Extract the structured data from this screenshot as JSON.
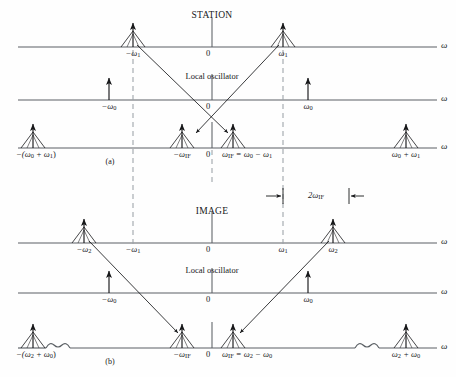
{
  "figure": {
    "title_station": "STATION",
    "title_image": "IMAGE",
    "lo_label_a": "Local oscillator",
    "lo_label_b": "Local oscillator",
    "panel_a_tag": "(a)",
    "panel_b_tag": "(b)",
    "bandwidth_label": "2ω",
    "bandwidth_label_sub": "IF",
    "axis_symbol": "ω",
    "origin_label": "0"
  },
  "colors": {
    "ink": "#17181a",
    "line": "#5a5f64",
    "dashed": "#9aa0a6",
    "background": "#ffffff"
  },
  "panel_a": {
    "name": "STATION",
    "rows": [
      {
        "id": "a-rf",
        "axis_label": "ω",
        "origin": "0",
        "impulses": [
          {
            "id": "a-rf-neg-w1",
            "x": 133,
            "label": "−ω",
            "label_sub": "1",
            "style": "tent"
          },
          {
            "id": "a-rf-pos-w1",
            "x": 283,
            "label": "ω",
            "label_sub": "1",
            "style": "tent"
          }
        ]
      },
      {
        "id": "a-lo",
        "axis_label": "ω",
        "origin": "0",
        "impulses": [
          {
            "id": "a-lo-neg-w0",
            "x": 109,
            "label": "−ω",
            "label_sub": "0",
            "style": "plain"
          },
          {
            "id": "a-lo-pos-w0",
            "x": 308,
            "label": "ω",
            "label_sub": "0",
            "style": "plain"
          }
        ]
      },
      {
        "id": "a-if",
        "axis_label": "ω",
        "origin": "0",
        "impulses": [
          {
            "id": "a-if-neg-sum",
            "x": 33,
            "label": "−(ω",
            "label_sub": "0",
            "label_2": " + ω",
            "label_sub2": "1",
            "label_3": ")",
            "style": "tent"
          },
          {
            "id": "a-if-neg-wif",
            "x": 182,
            "label": "−ω",
            "label_sub": "IF",
            "style": "tent"
          },
          {
            "id": "a-if-pos-wif",
            "x": 233,
            "label": "ω",
            "label_sub": "IF",
            "label_2": " = ω",
            "label_sub2": "0",
            "label_3": " − ω",
            "label_sub3": "1",
            "style": "tent"
          },
          {
            "id": "a-if-pos-sum",
            "x": 406,
            "label": "ω",
            "label_sub": "0",
            "label_2": " + ω",
            "label_sub2": "1",
            "style": "tent"
          }
        ]
      }
    ]
  },
  "panel_b": {
    "name": "IMAGE",
    "rows": [
      {
        "id": "b-rf",
        "axis_label": "ω",
        "origin": "0",
        "ticks": [
          {
            "id": "b-rf-tick-neg-w1",
            "x": 133,
            "label": "−ω",
            "label_sub": "1"
          },
          {
            "id": "b-rf-tick-pos-w1",
            "x": 283,
            "label": "ω",
            "label_sub": "1"
          }
        ],
        "impulses": [
          {
            "id": "b-rf-neg-w2",
            "x": 84,
            "label": "−ω",
            "label_sub": "2",
            "style": "tent"
          },
          {
            "id": "b-rf-pos-w2",
            "x": 333,
            "label": "ω",
            "label_sub": "2",
            "style": "tent"
          }
        ]
      },
      {
        "id": "b-lo",
        "axis_label": "ω",
        "origin": "0",
        "impulses": [
          {
            "id": "b-lo-neg-w0",
            "x": 109,
            "label": "−ω",
            "label_sub": "0",
            "style": "plain"
          },
          {
            "id": "b-lo-pos-w0",
            "x": 308,
            "label": "ω",
            "label_sub": "0",
            "style": "plain"
          }
        ]
      },
      {
        "id": "b-if",
        "axis_label": "ω",
        "origin": "0",
        "impulses": [
          {
            "id": "b-if-neg-sum",
            "x": 33,
            "label": "−(ω",
            "label_sub": "2",
            "label_2": " + ω",
            "label_sub2": "0",
            "label_3": ")",
            "style": "tent"
          },
          {
            "id": "b-if-neg-wif",
            "x": 182,
            "label": "−ω",
            "label_sub": "IF",
            "style": "tent"
          },
          {
            "id": "b-if-pos-wif",
            "x": 233,
            "label": "ω",
            "label_sub": "IF",
            "label_2": " = ω",
            "label_sub2": "2",
            "label_3": " − ω",
            "label_sub3": "0",
            "style": "tent"
          },
          {
            "id": "b-if-pos-sum",
            "x": 406,
            "label": "ω",
            "label_sub": "2",
            "label_2": " + ω",
            "label_sub2": "0",
            "style": "tent"
          }
        ]
      }
    ]
  }
}
